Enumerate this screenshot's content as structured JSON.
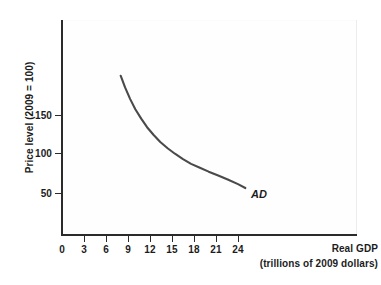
{
  "chart_data": {
    "type": "line",
    "title": "",
    "subtitle": "",
    "xlabel": "Real GDP",
    "xlabel_sub": "(trillions of 2009 dollars)",
    "ylabel": "Price level (2009 = 100)",
    "xticks": [
      0,
      3,
      6,
      9,
      12,
      15,
      18,
      21,
      24
    ],
    "xtick_labels": [
      "0",
      "3",
      "6",
      "9",
      "12",
      "15",
      "18",
      "21",
      "24"
    ],
    "yticks": [
      50,
      100,
      150
    ],
    "ytick_labels": [
      "50",
      "100",
      "150"
    ],
    "xlim": [
      0,
      27
    ],
    "ylim": [
      0,
      245
    ],
    "grid": false,
    "legend": "none",
    "series": [
      {
        "name": "AD",
        "label": "AD",
        "label_style": "italic",
        "color": "#4a4a4a",
        "linewidth": 2.1,
        "annotation_x": 25.5,
        "annotation_y": 50,
        "x": [
          8.0,
          8.6,
          9.3,
          10.0,
          10.8,
          11.6,
          12.5,
          13.4,
          14.4,
          15.4,
          16.5,
          17.6,
          18.8,
          20.0,
          21.3,
          22.6,
          24.0,
          25.0
        ],
        "y": [
          201,
          186,
          171,
          158,
          146,
          135,
          125,
          116,
          108,
          101,
          94,
          88,
          83,
          78,
          73,
          68,
          62,
          57
        ]
      }
    ]
  },
  "axes": {
    "x_axis_name": "real-gdp-axis",
    "y_axis_name": "price-level-axis"
  }
}
